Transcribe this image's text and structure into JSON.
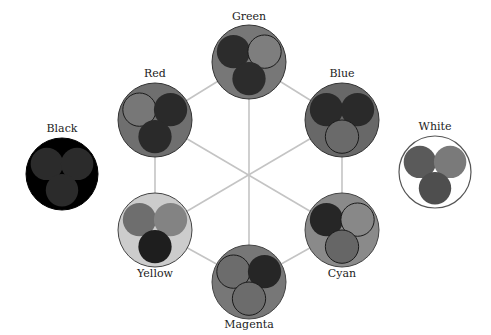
{
  "diagram": {
    "title": "",
    "center": {
      "x": 249,
      "y": 172
    },
    "spoke_color": "#c4c4c4",
    "nodes": [
      {
        "id": "green",
        "label": "Green",
        "cx": 249,
        "cy": 62,
        "r": 37,
        "fill": "#777777",
        "stroke": "#333333",
        "label_pos": {
          "x": 249,
          "y": 20
        },
        "dots": [
          {
            "pos": "top-left",
            "fill": "#2c2c2c",
            "outlined": false
          },
          {
            "pos": "top-right",
            "fill": "#7e7e7e",
            "outlined": true
          },
          {
            "pos": "bottom",
            "fill": "#2c2c2c",
            "outlined": false
          }
        ]
      },
      {
        "id": "red",
        "label": "Red",
        "cx": 155,
        "cy": 120,
        "r": 37,
        "fill": "#6f6f6f",
        "stroke": "#333333",
        "label_pos": {
          "x": 155,
          "y": 77
        },
        "dots": [
          {
            "pos": "top-left",
            "fill": "#777777",
            "outlined": true
          },
          {
            "pos": "top-right",
            "fill": "#2a2a2a",
            "outlined": false
          },
          {
            "pos": "bottom",
            "fill": "#2a2a2a",
            "outlined": false
          }
        ]
      },
      {
        "id": "blue",
        "label": "Blue",
        "cx": 342,
        "cy": 120,
        "r": 37,
        "fill": "#686868",
        "stroke": "#333333",
        "label_pos": {
          "x": 342,
          "y": 77
        },
        "dots": [
          {
            "pos": "top-left",
            "fill": "#2a2a2a",
            "outlined": false
          },
          {
            "pos": "top-right",
            "fill": "#2a2a2a",
            "outlined": false
          },
          {
            "pos": "bottom",
            "fill": "#6a6a6a",
            "outlined": true
          }
        ]
      },
      {
        "id": "yellow",
        "label": "Yellow",
        "cx": 155,
        "cy": 230,
        "r": 37,
        "fill": "#cccccc",
        "stroke": "#444444",
        "label_pos": {
          "x": 155,
          "y": 277
        },
        "dots": [
          {
            "pos": "top-left",
            "fill": "#6e6e6e",
            "outlined": false
          },
          {
            "pos": "top-right",
            "fill": "#838383",
            "outlined": false
          },
          {
            "pos": "bottom",
            "fill": "#1e1e1e",
            "outlined": false
          }
        ]
      },
      {
        "id": "cyan",
        "label": "Cyan",
        "cx": 342,
        "cy": 230,
        "r": 37,
        "fill": "#8a8a8a",
        "stroke": "#444444",
        "label_pos": {
          "x": 342,
          "y": 277
        },
        "dots": [
          {
            "pos": "top-left",
            "fill": "#262626",
            "outlined": false
          },
          {
            "pos": "top-right",
            "fill": "#888888",
            "outlined": true
          },
          {
            "pos": "bottom",
            "fill": "#666666",
            "outlined": true
          }
        ]
      },
      {
        "id": "magenta",
        "label": "Magenta",
        "cx": 249,
        "cy": 282,
        "r": 37,
        "fill": "#777777",
        "stroke": "#444444",
        "label_pos": {
          "x": 249,
          "y": 328
        },
        "dots": [
          {
            "pos": "top-left",
            "fill": "#6c6c6c",
            "outlined": true
          },
          {
            "pos": "top-right",
            "fill": "#262626",
            "outlined": false
          },
          {
            "pos": "bottom",
            "fill": "#6c6c6c",
            "outlined": true
          }
        ]
      },
      {
        "id": "black",
        "label": "Black",
        "cx": 62,
        "cy": 174,
        "r": 36,
        "fill": "#000000",
        "stroke": "#000000",
        "label_pos": {
          "x": 62,
          "y": 132
        },
        "dots": [
          {
            "pos": "top-left",
            "fill": "#2b2b2b",
            "outlined": false
          },
          {
            "pos": "top-right",
            "fill": "#2b2b2b",
            "outlined": false
          },
          {
            "pos": "bottom",
            "fill": "#2b2b2b",
            "outlined": false
          }
        ]
      },
      {
        "id": "white",
        "label": "White",
        "cx": 435,
        "cy": 172,
        "r": 36,
        "fill": "#ffffff",
        "stroke": "#555555",
        "label_pos": {
          "x": 435,
          "y": 130
        },
        "dots": [
          {
            "pos": "top-left",
            "fill": "#5a5a5a",
            "outlined": false
          },
          {
            "pos": "top-right",
            "fill": "#7a7a7a",
            "outlined": false
          },
          {
            "pos": "bottom",
            "fill": "#4e4e4e",
            "outlined": false
          }
        ]
      }
    ],
    "spokes": [
      [
        "green",
        "magenta"
      ],
      [
        "red",
        "cyan"
      ],
      [
        "blue",
        "yellow"
      ]
    ],
    "ring_edges": [
      [
        "green",
        "blue"
      ],
      [
        "blue",
        "cyan"
      ],
      [
        "cyan",
        "magenta"
      ],
      [
        "magenta",
        "yellow"
      ],
      [
        "yellow",
        "red"
      ],
      [
        "red",
        "green"
      ]
    ]
  }
}
